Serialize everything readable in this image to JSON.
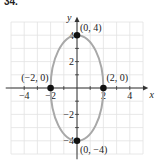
{
  "problem_number": "34.",
  "chart_data": {
    "type": "line",
    "title": "",
    "xlabel": "x",
    "ylabel": "y",
    "xlim": [
      -5,
      5
    ],
    "ylim": [
      -5,
      5
    ],
    "grid": true,
    "x_ticks": [
      -4,
      -2,
      2,
      4
    ],
    "y_ticks": [
      -4,
      -2,
      2,
      4
    ],
    "x_tick_labels": [
      "−4",
      "−2",
      "2",
      "4"
    ],
    "y_tick_labels": [
      "−4",
      "−2",
      "2",
      "4"
    ],
    "curve": {
      "shape": "ellipse",
      "center": [
        0,
        0
      ],
      "semi_axis_x": 2,
      "semi_axis_y": 4,
      "equation": "x^2/4 + y^2/16 = 1",
      "color": "#a8a8a8"
    },
    "points": [
      {
        "x": 0,
        "y": 4,
        "label": "(0, 4)"
      },
      {
        "x": 0,
        "y": -4,
        "label": "(0, −4)"
      },
      {
        "x": -2,
        "y": 0,
        "label": "(−2, 0)"
      },
      {
        "x": 2,
        "y": 0,
        "label": "(2, 0)"
      }
    ]
  }
}
